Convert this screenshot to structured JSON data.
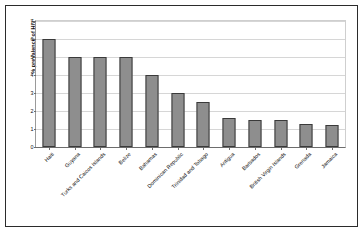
{
  "chart_data": {
    "type": "bar",
    "title": "",
    "xlabel": "",
    "ylabel": "% prevalence of HIV",
    "ylim": [
      0,
      7
    ],
    "ytick_step": 1,
    "yticks": [
      "0",
      "1",
      "2",
      "3",
      "4",
      "5",
      "6",
      "7"
    ],
    "grid": true,
    "legend": "none",
    "bar_color": "#8e8e8e",
    "bar_border_color": "#3a3a3a",
    "categories": [
      "Haiti",
      "Guyana",
      "Turks and Caicos Islands",
      "Belize",
      "Bahamas",
      "Dominican Republic",
      "Trinidad and Tobago",
      "Antigua",
      "Barbados",
      "British Virgin Islands",
      "Grenada",
      "Jamaica"
    ],
    "values": [
      6,
      5,
      5,
      5,
      4,
      3,
      2.5,
      1.6,
      1.5,
      1.5,
      1.3,
      1.2
    ]
  }
}
